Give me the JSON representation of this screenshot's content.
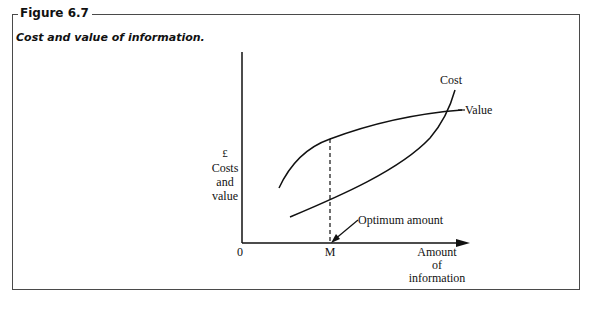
{
  "figure": {
    "label": "Figure 6.7",
    "caption": "Cost and value of information."
  },
  "axes": {
    "y_label_currency": "£",
    "y_label_line1": "Costs",
    "y_label_line2": "and",
    "y_label_line3": "value",
    "x_label_line1": "Amount",
    "x_label_line2": "of",
    "x_label_line3": "information",
    "origin_label": "0",
    "x_marker_label": "M"
  },
  "curves": {
    "cost_label": "Cost",
    "value_label": "Value"
  },
  "annotation": {
    "optimum_label": "Optimum amount"
  },
  "colors": {
    "ink": "#111111",
    "frame": "#4a4a4a",
    "background": "#ffffff"
  }
}
